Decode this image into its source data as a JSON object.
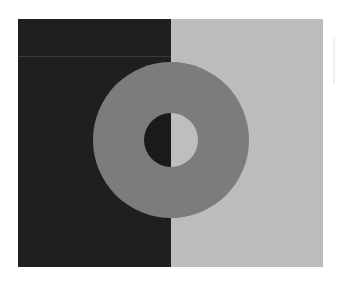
{
  "figure": {
    "colors": {
      "page_bg": "#ffffff",
      "dark_panel": "#1f1f1f",
      "light_panel": "#bcbcbc",
      "ring": "#7c7c7c",
      "inner_dark": "#1a1a1a",
      "inner_light": "#bebebe",
      "seam_line": "#6a6a6a"
    },
    "geometry": {
      "frame": {
        "left": 18,
        "top": 19,
        "right": 323,
        "bottom": 267
      },
      "split_x": 171,
      "ring_center": [
        171,
        140
      ],
      "ring_outer_radius": 78,
      "ring_inner_radius": 27
    }
  }
}
